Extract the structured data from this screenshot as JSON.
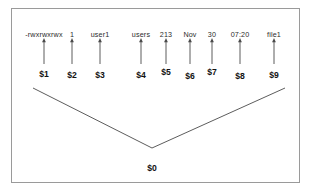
{
  "diagram": {
    "frame": {
      "border_color": "#9a9a9a",
      "background": "#ffffff"
    },
    "line_color": "#4a4a4a",
    "text_color": "#2b2b2b",
    "var_text_color": "#111111",
    "fields": [
      {
        "text": "-rwxrwxrwx",
        "variable": "$1",
        "text_x": 44,
        "arrow_x": 44,
        "var_x": 44,
        "var_y": 70
      },
      {
        "text": "1",
        "variable": "$2",
        "text_x": 72,
        "arrow_x": 72,
        "var_x": 72,
        "var_y": 71
      },
      {
        "text": "user1",
        "variable": "$3",
        "text_x": 100,
        "arrow_x": 100,
        "var_x": 100,
        "var_y": 71
      },
      {
        "text": "users",
        "variable": "$4",
        "text_x": 141,
        "arrow_x": 141,
        "var_x": 141,
        "var_y": 71
      },
      {
        "text": "213",
        "variable": "$5",
        "text_x": 166,
        "arrow_x": 166,
        "var_x": 166,
        "var_y": 68
      },
      {
        "text": "Nov",
        "variable": "$6",
        "text_x": 190,
        "arrow_x": 190,
        "var_x": 190,
        "var_y": 72
      },
      {
        "text": "30",
        "variable": "$7",
        "text_x": 212,
        "arrow_x": 212,
        "var_x": 212,
        "var_y": 68
      },
      {
        "text": "07:20",
        "variable": "$8",
        "text_x": 240,
        "arrow_x": 240,
        "var_x": 240,
        "var_y": 72
      },
      {
        "text": "file1",
        "variable": "$9",
        "text_x": 274,
        "arrow_x": 274,
        "var_x": 274,
        "var_y": 71
      }
    ],
    "whole_line": {
      "variable": "$0",
      "label_x": 152,
      "label_y": 164
    },
    "arrows": {
      "shaft_top_y": 38,
      "shaft_bottom_y": 64
    },
    "brace": {
      "left_start_x": 33,
      "left_start_y": 88,
      "vertex_x": 152,
      "vertex_y": 148,
      "right_end_x": 285,
      "right_end_y": 88
    },
    "field_row_y": 31
  }
}
